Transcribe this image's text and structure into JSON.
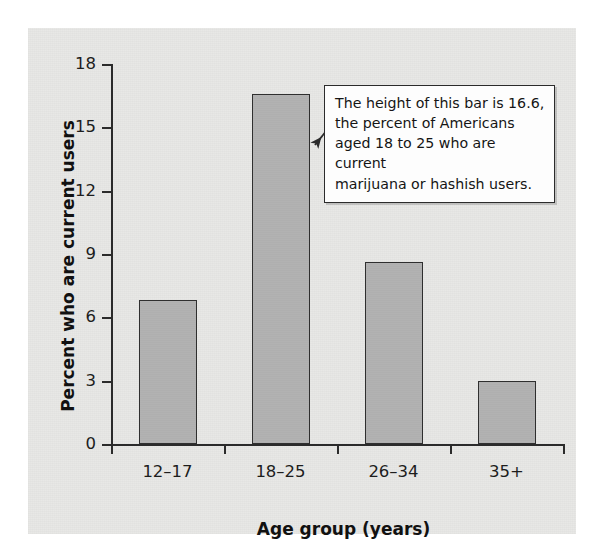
{
  "chart_data": {
    "type": "bar",
    "title": "",
    "xlabel": "Age group (years)",
    "ylabel": "Percent who are current users",
    "categories": [
      "12–17",
      "18–25",
      "26–34",
      "35+"
    ],
    "values": [
      6.8,
      16.6,
      8.6,
      3.0
    ],
    "ylim": [
      0,
      18
    ],
    "yticks": [
      0,
      3,
      6,
      9,
      12,
      15,
      18
    ],
    "ytick_labels": [
      "0",
      "3",
      "6",
      "9",
      "12",
      "15",
      "18"
    ],
    "grid": false,
    "legend": "none",
    "bar_color": "#b2b2b2",
    "bar_edge_color": "#2f2f2f",
    "panel_background": "#e8e8e6",
    "annotation": {
      "text": "The height of this bar is 16.6, the percent of Americans aged 18 to 25 who are current marijuana or hashish users.",
      "lines": [
        "The height of this bar is 16.6,",
        "the percent of Americans",
        "aged 18 to 25 who are current",
        "marijuana or hashish users."
      ],
      "points_to_category": "18–25",
      "points_to_value": 16.6
    }
  }
}
